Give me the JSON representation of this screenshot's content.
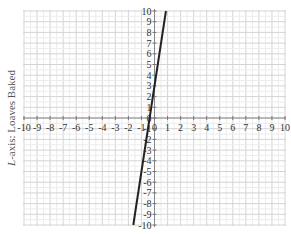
{
  "chart_data": {
    "type": "line",
    "title": "",
    "xlabel": "",
    "ylabel": "L-axis: Loaves Baked",
    "ylabel_var": "L",
    "ylabel_rest": "-axis: Loaves Baked",
    "xlim": [
      -10,
      10
    ],
    "ylim": [
      -10,
      10
    ],
    "grid": true,
    "x_ticks": [
      -10,
      -9,
      -8,
      -7,
      -6,
      -5,
      -4,
      -3,
      -2,
      -1,
      0,
      1,
      2,
      3,
      4,
      5,
      6,
      7,
      8,
      9,
      10
    ],
    "y_ticks": [
      -10,
      -9,
      -8,
      -7,
      -6,
      -5,
      -4,
      -3,
      -2,
      -1,
      0,
      1,
      2,
      3,
      4,
      5,
      6,
      7,
      8,
      9,
      10
    ],
    "series": [
      {
        "name": "L = 8x + 3",
        "slope": 8,
        "intercept": 3,
        "x": [
          -1.625,
          0.875
        ],
        "y": [
          -10,
          10
        ],
        "color": "#222222"
      }
    ]
  },
  "colors": {
    "grid": "#d8d8d8",
    "axis": "#888888",
    "line": "#222222"
  }
}
